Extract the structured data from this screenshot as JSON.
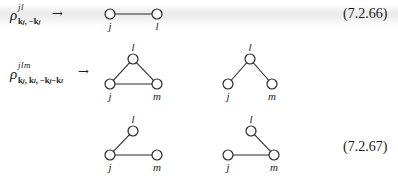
{
  "equations": [
    {
      "id": "7.2.66",
      "lhs": {
        "symbol": "ρ",
        "superscript": "jl",
        "subscript": "k_j, −k_j",
        "sub_parts": [
          "k",
          "j",
          ", −",
          "k",
          "j"
        ]
      },
      "arrow": "→",
      "number": "(7.2.66)",
      "graphs": [
        {
          "nodes": [
            {
              "label": "j",
              "x": 110,
              "y": 14
            },
            {
              "label": "l",
              "x": 157,
              "y": 14
            }
          ],
          "edges": [
            [
              "j",
              "l"
            ]
          ]
        }
      ]
    },
    {
      "id": "7.2.67",
      "lhs": {
        "symbol": "ρ",
        "superscript": "jlm",
        "subscript": "k_j, k_l, −k_j−k_l",
        "sub_parts": [
          "k",
          "j",
          ", ",
          "k",
          "l",
          ", −",
          "k",
          "j",
          "−",
          "k",
          "l"
        ]
      },
      "arrow": "→",
      "number": "(7.2.67)",
      "graphs": [
        {
          "nodes": [
            {
              "label": "l",
              "x": 133,
              "y": 59
            },
            {
              "label": "j",
              "x": 110,
              "y": 84
            },
            {
              "label": "m",
              "x": 157,
              "y": 84
            }
          ],
          "edges": [
            [
              "j",
              "l"
            ],
            [
              "l",
              "m"
            ],
            [
              "j",
              "m"
            ]
          ]
        },
        {
          "nodes": [
            {
              "label": "l",
              "x": 250,
              "y": 59
            },
            {
              "label": "j",
              "x": 228,
              "y": 84
            },
            {
              "label": "m",
              "x": 272,
              "y": 84
            }
          ],
          "edges": [
            [
              "j",
              "l"
            ],
            [
              "l",
              "m"
            ]
          ]
        },
        {
          "nodes": [
            {
              "label": "l",
              "x": 133,
              "y": 131
            },
            {
              "label": "j",
              "x": 110,
              "y": 155
            },
            {
              "label": "m",
              "x": 157,
              "y": 155
            }
          ],
          "edges": [
            [
              "j",
              "l"
            ],
            [
              "j",
              "m"
            ]
          ]
        },
        {
          "nodes": [
            {
              "label": "l",
              "x": 251,
              "y": 131
            },
            {
              "label": "j",
              "x": 228,
              "y": 155
            },
            {
              "label": "m",
              "x": 274,
              "y": 155
            }
          ],
          "edges": [
            [
              "l",
              "m"
            ],
            [
              "j",
              "m"
            ]
          ]
        }
      ]
    }
  ]
}
